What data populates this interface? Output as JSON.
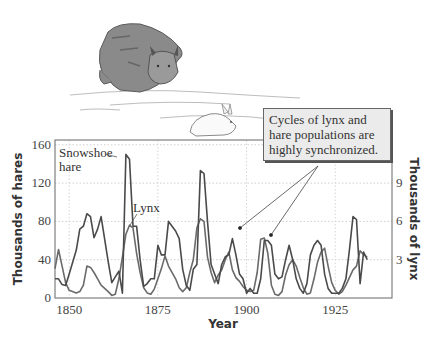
{
  "illustration": {
    "description": "Pencil drawing of a lynx chasing a snowshoe hare across snow",
    "subjects": [
      "lynx",
      "snowshoe hare"
    ]
  },
  "callout": {
    "text": "Cycles of lynx and hare populations are highly synchronized."
  },
  "chart_data": {
    "type": "line",
    "title": "",
    "xlabel": "Year",
    "ylabel": "Thousands of hares",
    "y2label": "Thousands of lynx",
    "xlim": [
      1846,
      1941
    ],
    "ylim": [
      0,
      165
    ],
    "y2lim": [
      0,
      12.375
    ],
    "x_ticks": [
      1850,
      1875,
      1900,
      1925
    ],
    "y_ticks": [
      0,
      40,
      80,
      120,
      160
    ],
    "y2_ticks": [
      3,
      6,
      9
    ],
    "grid": "dotted horizontal and vertical",
    "legend": "inline labels",
    "annotations": [
      {
        "text": "Snowshoe hare",
        "target_year": 1866
      },
      {
        "text": "Lynx",
        "target_year": 1869
      },
      {
        "text": "Cycles of lynx and hare populations are highly synchronized.",
        "points_to_years": [
          1897,
          1905
        ]
      }
    ],
    "series": [
      {
        "name": "Snowshoe hare",
        "axis": "left",
        "units": "thousands of hares",
        "color": "#4a4a4a",
        "x": [
          1846,
          1847,
          1848,
          1849,
          1850,
          1852,
          1853,
          1854,
          1855,
          1856,
          1857,
          1858,
          1859,
          1861,
          1862,
          1863,
          1864,
          1865,
          1866,
          1867,
          1868,
          1869,
          1870,
          1871,
          1872,
          1873,
          1874,
          1875,
          1876,
          1877,
          1878,
          1880,
          1881,
          1882,
          1883,
          1884,
          1885,
          1886,
          1887,
          1888,
          1889,
          1890,
          1891,
          1892,
          1893,
          1894,
          1895,
          1896,
          1897,
          1898,
          1899,
          1900,
          1901,
          1902,
          1903,
          1904,
          1905,
          1906,
          1907,
          1908,
          1909,
          1910,
          1911,
          1912,
          1913,
          1914,
          1915,
          1916,
          1917,
          1918,
          1919,
          1920,
          1921,
          1922,
          1923,
          1924,
          1925,
          1926,
          1927,
          1928,
          1929,
          1930,
          1931,
          1932,
          1933,
          1934
        ],
        "values": [
          20,
          20,
          14,
          13,
          25,
          50,
          72,
          75,
          88,
          85,
          63,
          72,
          85,
          38,
          16,
          22,
          28,
          5,
          150,
          145,
          75,
          75,
          40,
          12,
          15,
          20,
          20,
          55,
          45,
          45,
          80,
          70,
          62,
          30,
          13,
          8,
          30,
          35,
          133,
          130,
          80,
          35,
          25,
          15,
          35,
          43,
          45,
          62,
          45,
          25,
          20,
          5,
          10,
          5,
          5,
          20,
          60,
          60,
          55,
          25,
          20,
          22,
          40,
          55,
          40,
          20,
          10,
          5,
          15,
          45,
          55,
          60,
          55,
          25,
          10,
          5,
          5,
          5,
          10,
          20,
          50,
          85,
          82,
          15,
          48,
          40
        ]
      },
      {
        "name": "Lynx",
        "axis": "right",
        "units": "thousands of lynx",
        "color": "#6a6a6a",
        "x": [
          1846,
          1847,
          1848,
          1849,
          1850,
          1852,
          1853,
          1854,
          1855,
          1856,
          1857,
          1858,
          1859,
          1861,
          1862,
          1863,
          1864,
          1865,
          1866,
          1867,
          1868,
          1869,
          1870,
          1871,
          1872,
          1873,
          1874,
          1875,
          1876,
          1877,
          1878,
          1880,
          1881,
          1882,
          1883,
          1884,
          1885,
          1886,
          1887,
          1888,
          1889,
          1890,
          1891,
          1892,
          1893,
          1894,
          1895,
          1896,
          1897,
          1898,
          1899,
          1900,
          1901,
          1902,
          1903,
          1904,
          1905,
          1906,
          1907,
          1908,
          1909,
          1910,
          1911,
          1912,
          1913,
          1914,
          1915,
          1916,
          1917,
          1918,
          1919,
          1920,
          1921,
          1922,
          1923,
          1924,
          1925,
          1926,
          1927,
          1928,
          1929,
          1930,
          1931,
          1932,
          1933,
          1934
        ],
        "values": [
          2.3,
          3.8,
          2.5,
          1.2,
          0.6,
          0.4,
          0.5,
          1.0,
          2.5,
          2.4,
          2.0,
          1.5,
          1.0,
          0.5,
          0.2,
          0.3,
          1.5,
          3.2,
          5.0,
          5.7,
          5.5,
          3.5,
          2.0,
          0.8,
          0.4,
          0.3,
          0.7,
          1.5,
          2.3,
          3.3,
          2.5,
          1.5,
          0.8,
          0.5,
          0.8,
          2.0,
          3.0,
          5.5,
          6.2,
          6.0,
          3.2,
          2.0,
          1.2,
          1.8,
          2.2,
          3.0,
          3.6,
          2.2,
          1.6,
          1.3,
          0.9,
          0.6,
          0.5,
          0.6,
          2.0,
          4.6,
          4.7,
          3.5,
          1.0,
          0.3,
          0.2,
          0.5,
          1.8,
          2.6,
          3.0,
          2.5,
          1.6,
          0.8,
          0.3,
          0.4,
          1.5,
          2.8,
          3.6,
          3.9,
          2.5,
          1.2,
          0.6,
          0.3,
          0.5,
          1.0,
          1.6,
          2.2,
          2.5,
          3.7,
          3.4,
          3.2
        ]
      }
    ]
  }
}
